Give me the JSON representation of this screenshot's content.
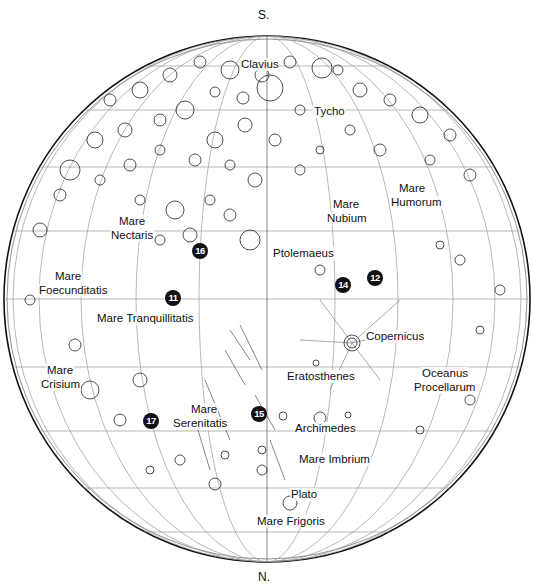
{
  "map": {
    "title": "Lunar near side map (south up)",
    "poles": {
      "top": "S.",
      "bottom": "N."
    },
    "features": [
      {
        "id": "clavius",
        "label": "Clavius",
        "x": 240,
        "y": 58
      },
      {
        "id": "tycho",
        "label": "Tycho",
        "x": 313,
        "y": 105
      },
      {
        "id": "mare-humorum-1",
        "label": "Mare",
        "x": 398,
        "y": 182
      },
      {
        "id": "mare-humorum-2",
        "label": "Humorum",
        "x": 390,
        "y": 196
      },
      {
        "id": "mare-nubium-1",
        "label": "Mare",
        "x": 332,
        "y": 198
      },
      {
        "id": "mare-nubium-2",
        "label": "Nubium",
        "x": 326,
        "y": 212
      },
      {
        "id": "mare-nectaris-1",
        "label": "Mare",
        "x": 118,
        "y": 215
      },
      {
        "id": "mare-nectaris-2",
        "label": "Nectaris",
        "x": 110,
        "y": 229
      },
      {
        "id": "ptolemaeus",
        "label": "Ptolemaeus",
        "x": 272,
        "y": 247
      },
      {
        "id": "mare-foecunditatis-1",
        "label": "Mare",
        "x": 54,
        "y": 270
      },
      {
        "id": "mare-foecunditatis-2",
        "label": "Foecunditatis",
        "x": 38,
        "y": 284
      },
      {
        "id": "mare-tranquillitatis",
        "label": "Mare Tranquillitatis",
        "x": 96,
        "y": 312
      },
      {
        "id": "copernicus",
        "label": "Copernicus",
        "x": 365,
        "y": 330
      },
      {
        "id": "eratosthenes",
        "label": "Eratosthenes",
        "x": 286,
        "y": 370
      },
      {
        "id": "oceanus-procellarum-1",
        "label": "Oceanus",
        "x": 421,
        "y": 367
      },
      {
        "id": "oceanus-procellarum-2",
        "label": "Procellarum",
        "x": 413,
        "y": 381
      },
      {
        "id": "mare-crisium-1",
        "label": "Mare",
        "x": 46,
        "y": 364
      },
      {
        "id": "mare-crisium-2",
        "label": "Crisium",
        "x": 40,
        "y": 378
      },
      {
        "id": "mare-serenitatis-1",
        "label": "Mare",
        "x": 190,
        "y": 403
      },
      {
        "id": "mare-serenitatis-2",
        "label": "Serenitatis",
        "x": 172,
        "y": 417
      },
      {
        "id": "archimedes",
        "label": "Archimedes",
        "x": 294,
        "y": 422
      },
      {
        "id": "mare-imbrium",
        "label": "Mare Imbrium",
        "x": 298,
        "y": 453
      },
      {
        "id": "plato",
        "label": "Plato",
        "x": 290,
        "y": 488
      },
      {
        "id": "mare-frigoris",
        "label": "Mare Frigoris",
        "x": 256,
        "y": 515
      }
    ],
    "landing_sites": [
      {
        "number": "11",
        "x": 173,
        "y": 298
      },
      {
        "number": "12",
        "x": 375,
        "y": 278
      },
      {
        "number": "14",
        "x": 343,
        "y": 285
      },
      {
        "number": "15",
        "x": 259,
        "y": 414
      },
      {
        "number": "16",
        "x": 200,
        "y": 251
      },
      {
        "number": "17",
        "x": 151,
        "y": 421
      }
    ],
    "colors": {
      "line": "#111111",
      "grid": "#9a9a9a",
      "marker": "#111111",
      "background": "#ffffff"
    }
  }
}
